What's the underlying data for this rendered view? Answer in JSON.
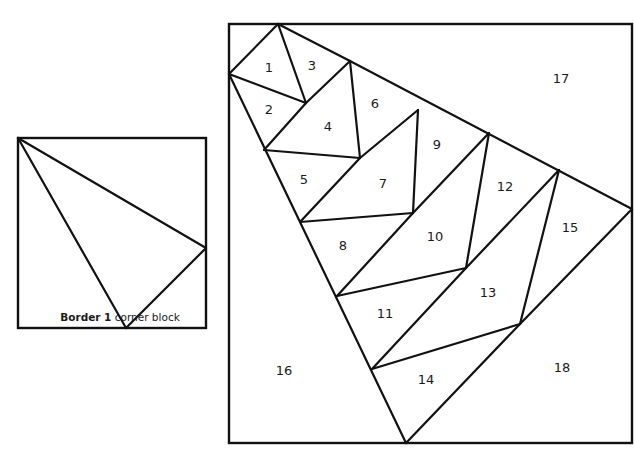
{
  "caption": {
    "bold": "Border 1",
    "rest": " corner block"
  },
  "colors": {
    "line": "#111111",
    "background": "#ffffff"
  },
  "corner_block": {
    "square": [
      18,
      138,
      206,
      328
    ],
    "lines": [
      [
        18,
        138,
        206,
        248
      ],
      [
        18,
        138,
        126,
        328
      ],
      [
        206,
        248,
        126,
        328
      ]
    ]
  },
  "block": {
    "square": [
      229,
      24,
      632,
      443
    ],
    "lines": [
      [
        278,
        24,
        229,
        74
      ],
      [
        278,
        24,
        306,
        103
      ],
      [
        229,
        74,
        306,
        103
      ],
      [
        278,
        24,
        350,
        61
      ],
      [
        306,
        103,
        350,
        61
      ],
      [
        350,
        61,
        632,
        209
      ],
      [
        229,
        74,
        406,
        443
      ],
      [
        306,
        103,
        264,
        150
      ],
      [
        350,
        61,
        360,
        158
      ],
      [
        264,
        150,
        360,
        158
      ],
      [
        360,
        158,
        300,
        222
      ],
      [
        418,
        110,
        360,
        158
      ],
      [
        418,
        110,
        413,
        213
      ],
      [
        300,
        222,
        413,
        213
      ],
      [
        489,
        133,
        413,
        213
      ],
      [
        413,
        213,
        337,
        296
      ],
      [
        489,
        133,
        466,
        268
      ],
      [
        337,
        296,
        466,
        268
      ],
      [
        559,
        170,
        466,
        268
      ],
      [
        466,
        268,
        372,
        369
      ],
      [
        559,
        170,
        520,
        324
      ],
      [
        372,
        369,
        520,
        324
      ],
      [
        632,
        209,
        520,
        324
      ],
      [
        520,
        324,
        406,
        443
      ]
    ],
    "labels": [
      {
        "n": "1",
        "x": 269,
        "y": 68
      },
      {
        "n": "2",
        "x": 269,
        "y": 110
      },
      {
        "n": "3",
        "x": 312,
        "y": 66
      },
      {
        "n": "4",
        "x": 328,
        "y": 127
      },
      {
        "n": "5",
        "x": 304,
        "y": 180
      },
      {
        "n": "6",
        "x": 375,
        "y": 104
      },
      {
        "n": "7",
        "x": 383,
        "y": 184
      },
      {
        "n": "8",
        "x": 343,
        "y": 246
      },
      {
        "n": "9",
        "x": 437,
        "y": 145
      },
      {
        "n": "10",
        "x": 435,
        "y": 237
      },
      {
        "n": "11",
        "x": 385,
        "y": 314
      },
      {
        "n": "12",
        "x": 505,
        "y": 187
      },
      {
        "n": "13",
        "x": 488,
        "y": 293
      },
      {
        "n": "14",
        "x": 426,
        "y": 380
      },
      {
        "n": "15",
        "x": 570,
        "y": 228
      },
      {
        "n": "16",
        "x": 284,
        "y": 371
      },
      {
        "n": "17",
        "x": 561,
        "y": 79
      },
      {
        "n": "18",
        "x": 562,
        "y": 368
      }
    ]
  }
}
